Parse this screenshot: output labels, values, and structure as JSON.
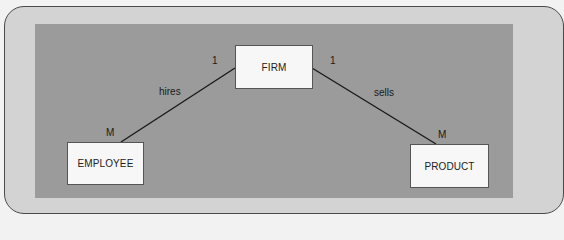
{
  "diagram": {
    "type": "entity-relationship",
    "colors": {
      "page_background": "#f2f2f2",
      "outer_panel": "#d3d3d3",
      "inner_panel": "#9b9b9b",
      "entity_fill": "#f7f7f7",
      "line": "#1a1a1a"
    },
    "entities": {
      "firm": {
        "label": "FIRM"
      },
      "employee": {
        "label": "EMPLOYEE"
      },
      "product": {
        "label": "PRODUCT"
      }
    },
    "relationships": [
      {
        "name": "hires",
        "from": "FIRM",
        "to": "EMPLOYEE",
        "from_cardinality": "1",
        "to_cardinality": "M"
      },
      {
        "name": "sells",
        "from": "FIRM",
        "to": "PRODUCT",
        "from_cardinality": "1",
        "to_cardinality": "M"
      }
    ]
  }
}
